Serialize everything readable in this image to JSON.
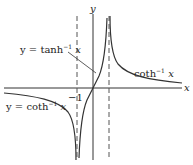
{
  "figure": {
    "axis_labels": {
      "x": "x",
      "y": "y"
    },
    "tick_labels": {
      "neg_one": "−1"
    },
    "annotations": {
      "tanh_label": {
        "prefix": "y = tanh",
        "sup": "−1",
        "var": " x"
      },
      "coth_right_label": {
        "prefix": "coth",
        "sup": "−1",
        "var": " x"
      },
      "coth_left_label": {
        "prefix": "y = coth",
        "sup": "−1",
        "var": " x"
      }
    },
    "asymptotes": [
      "x = −1",
      "x = 1"
    ],
    "colors": {
      "curve": "#333333",
      "axis": "#333333",
      "dash": "#555555"
    }
  }
}
